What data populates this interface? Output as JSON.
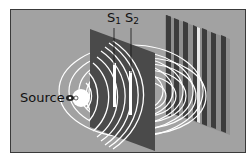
{
  "diagram": {
    "labels": {
      "source": "Source",
      "slit1": {
        "base": "S",
        "sub": "1"
      },
      "slit2": {
        "base": "S",
        "sub": "2"
      }
    },
    "colors": {
      "background": "#a2a2a2",
      "barrier": "#4a4a4a",
      "waves": "#ffffff",
      "fringe_dark": "#3c3c3c",
      "border": "#3a3a3a"
    },
    "elements": [
      "light-source",
      "barrier-with-two-slits",
      "circular-wavefronts",
      "interference-fringe-screen"
    ]
  }
}
